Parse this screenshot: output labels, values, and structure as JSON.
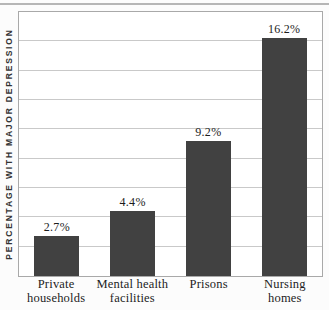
{
  "colors": {
    "bar_fill": "#414141",
    "gridline": "#c9c9c9",
    "plot_border": "#a9a9a9",
    "top_rule": "#b6b6b6",
    "text": "#1c1c1c",
    "axis_label_text": "#333333",
    "background": "#fcfcfc"
  },
  "chart_data": {
    "type": "bar",
    "title": "",
    "categories": [
      "Private households",
      "Mental health facilities",
      "Prisons",
      "Nursing homes"
    ],
    "category_lines": [
      [
        "Private",
        "households"
      ],
      [
        "Mental health",
        "facilities"
      ],
      [
        "Prisons"
      ],
      [
        "Nursing homes"
      ]
    ],
    "values": [
      2.7,
      4.4,
      9.2,
      16.2
    ],
    "value_labels": [
      "2.7%",
      "4.4%",
      "9.2%",
      "16.2%"
    ],
    "xlabel": "",
    "ylabel": "PERCENTAGE WITH MAJOR DEPRESSION",
    "ylim": [
      0,
      18
    ],
    "gridline_interval": 2,
    "grid": true,
    "y_tick_labels_shown": false,
    "legend": false,
    "bar_label_position": "above"
  }
}
